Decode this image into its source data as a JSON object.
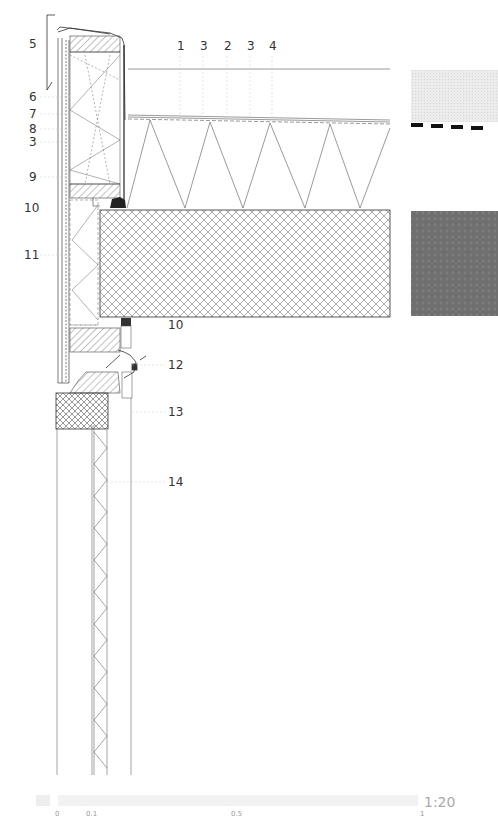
{
  "drawing": {
    "title": "Architectural wall and floor section detail",
    "scale": "1:20",
    "top_labels": [
      {
        "text": "1",
        "x": 180
      },
      {
        "text": "3",
        "x": 203
      },
      {
        "text": "2",
        "x": 227
      },
      {
        "text": "3",
        "x": 250
      },
      {
        "text": "4",
        "x": 272
      }
    ],
    "left_labels": [
      {
        "text": "5",
        "y": 44
      },
      {
        "text": "6",
        "y": 97
      },
      {
        "text": "7",
        "y": 114
      },
      {
        "text": "8",
        "y": 129
      },
      {
        "text": "3",
        "y": 142
      },
      {
        "text": "9",
        "y": 177
      },
      {
        "text": "10",
        "y": 208
      },
      {
        "text": "11",
        "y": 255
      }
    ],
    "right_labels": [
      {
        "text": "10",
        "x": 168,
        "y": 325
      },
      {
        "text": "12",
        "x": 168,
        "y": 365
      },
      {
        "text": "13",
        "x": 168,
        "y": 412
      },
      {
        "text": "14",
        "x": 168,
        "y": 482
      }
    ],
    "swatches": [
      {
        "name": "light-swatch",
        "color": "#e8e8e8"
      },
      {
        "name": "dark-swatch",
        "color": "#6e6e6e"
      }
    ],
    "scalebar": {
      "ticks": [
        {
          "text": "0",
          "x": 57
        },
        {
          "text": "0.1",
          "x": 88
        },
        {
          "text": "0.5",
          "x": 233
        },
        {
          "text": "1",
          "x": 420
        }
      ]
    }
  }
}
